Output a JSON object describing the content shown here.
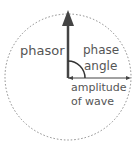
{
  "diagram": {
    "labels": {
      "phasor": "phasor",
      "phase_angle_line1": "phase",
      "phase_angle_line2": "angle",
      "amplitude_line1": "amplitude",
      "amplitude_line2": "of wave"
    },
    "colors": {
      "circle": "#888888",
      "arrow": "#444444",
      "text": "#555555"
    }
  }
}
